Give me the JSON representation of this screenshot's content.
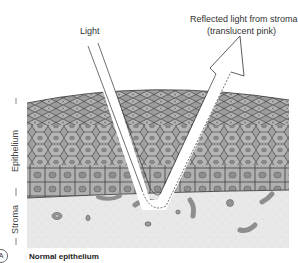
{
  "labels": {
    "light": "Light",
    "reflected_line1": "Reflected light from stroma",
    "reflected_line2": "(translucent pink)",
    "epithelium": "Epithelium",
    "stroma": "Stroma",
    "caption": "Normal epithelium",
    "panel_marker": "A"
  },
  "colors": {
    "epithelium_fill": "#a8a8a8",
    "stroma_fill": "#e6e6e6",
    "cell_line": "#3a3a3a",
    "beam_fill": "#ffffff"
  }
}
